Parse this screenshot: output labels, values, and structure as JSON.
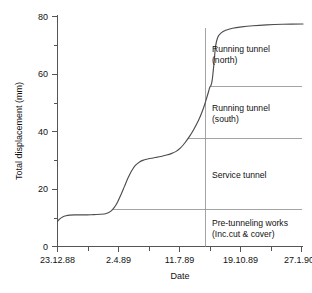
{
  "chart_data": {
    "type": "line",
    "title": "",
    "xlabel": "Date",
    "ylabel": "Total displacement (mm)",
    "ylim": [
      0,
      80
    ],
    "ytick_labels": [
      "0",
      "20",
      "40",
      "60",
      "80"
    ],
    "ytick_values": [
      0,
      20,
      40,
      60,
      80
    ],
    "yminor_values": [
      10,
      30,
      50,
      70
    ],
    "xtick_labels": [
      "23.12.88",
      "2.4.89",
      "11.7.89",
      "19.10.89",
      "27.1.90"
    ],
    "xtick_values": [
      0,
      100,
      200,
      300,
      400
    ],
    "xminor_values": [
      50,
      150,
      250,
      350
    ],
    "xlim": [
      0,
      432
    ],
    "grid": false,
    "legend": "none",
    "series": [
      {
        "name": "Total displacement",
        "x": [
          0,
          4,
          9,
          15,
          22,
          30,
          40,
          52,
          64,
          76,
          86,
          94,
          100,
          106,
          112,
          118,
          124,
          130,
          137,
          145,
          152,
          160,
          168,
          176,
          184,
          192,
          200,
          208,
          216,
          224,
          232,
          240,
          248,
          254,
          259,
          263,
          266,
          268,
          270,
          272,
          274,
          276,
          278,
          282,
          288,
          296,
          308,
          324,
          344,
          368,
          396,
          432
        ],
        "y": [
          8.7,
          9.6,
          10.3,
          10.7,
          10.9,
          11.0,
          11.0,
          11.0,
          11.1,
          11.2,
          11.5,
          12.3,
          13.6,
          15.6,
          18.2,
          21.0,
          23.8,
          26.2,
          28.2,
          29.5,
          30.1,
          30.5,
          30.8,
          31.1,
          31.4,
          31.8,
          32.3,
          33.0,
          34.2,
          36.0,
          38.2,
          40.8,
          43.8,
          46.6,
          49.4,
          52.0,
          54.0,
          55.4,
          56.0,
          57.6,
          61.0,
          65.0,
          69.5,
          72.8,
          74.3,
          75.2,
          75.9,
          76.4,
          76.8,
          77.1,
          77.3,
          77.4
        ]
      }
    ],
    "annotations": [
      {
        "id": "running-tunnel-north",
        "lines": [
          "Running tunnel",
          "(north)"
        ],
        "band_top_mm": 77.4,
        "band_bottom_mm": 55.5
      },
      {
        "id": "running-tunnel-south",
        "lines": [
          "Running tunnel",
          "(south)"
        ],
        "band_top_mm": 55.5,
        "band_bottom_mm": 37.5
      },
      {
        "id": "service-tunnel",
        "lines": [
          "Service tunnel"
        ],
        "band_top_mm": 37.5,
        "band_bottom_mm": 12.9
      },
      {
        "id": "pre-tunneling-works",
        "lines": [
          "Pre-tunneling works",
          "(Inc.cut & cover)"
        ],
        "band_top_mm": 12.9,
        "band_bottom_mm": 0
      }
    ],
    "divider_values_mm": [
      55.5,
      37.5,
      12.9
    ],
    "vertical_marker_x": 305,
    "colors": {
      "curve": "#4d4d4d",
      "axis": "#555555",
      "divider": "#8d8d8d",
      "text": "#111111",
      "background": "#ffffff"
    }
  }
}
